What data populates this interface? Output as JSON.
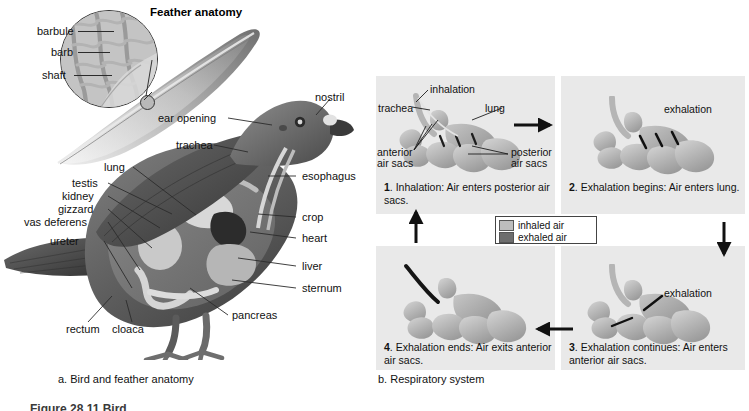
{
  "figure": {
    "number_line": "Figure 28.11  Bird",
    "panel_a_caption": "a. Bird and feather anatomy",
    "panel_b_caption": "b. Respiratory system"
  },
  "panel_a": {
    "title": "Feather anatomy",
    "feather_labels": [
      {
        "id": "barbule",
        "label": "barbule"
      },
      {
        "id": "barb",
        "label": "barb"
      },
      {
        "id": "shaft",
        "label": "shaft"
      }
    ],
    "bird_labels_left": [
      {
        "id": "lung",
        "label": "lung"
      },
      {
        "id": "testis",
        "label": "testis"
      },
      {
        "id": "kidney",
        "label": "kidney"
      },
      {
        "id": "gizzard",
        "label": "gizzard"
      },
      {
        "id": "vas-deferens",
        "label": "vas deferens"
      },
      {
        "id": "ureter",
        "label": "ureter"
      },
      {
        "id": "rectum",
        "label": "rectum"
      },
      {
        "id": "cloaca",
        "label": "cloaca"
      }
    ],
    "bird_labels_head": [
      {
        "id": "ear-opening",
        "label": "ear opening"
      },
      {
        "id": "nostril",
        "label": "nostril"
      },
      {
        "id": "trachea",
        "label": "trachea"
      }
    ],
    "bird_labels_right": [
      {
        "id": "esophagus",
        "label": "esophagus"
      },
      {
        "id": "crop",
        "label": "crop"
      },
      {
        "id": "heart",
        "label": "heart"
      },
      {
        "id": "liver",
        "label": "liver"
      },
      {
        "id": "sternum",
        "label": "sternum"
      },
      {
        "id": "pancreas",
        "label": "pancreas"
      }
    ]
  },
  "panel_b": {
    "legend": [
      {
        "id": "inhaled-air",
        "label": "inhaled air",
        "color": "#bdbdbd"
      },
      {
        "id": "exhaled-air",
        "label": "exhaled air",
        "color": "#6e6e6e"
      }
    ],
    "steps": [
      {
        "num": "1",
        "text": "Inhalation: Air enters posterior air sacs."
      },
      {
        "num": "2",
        "text": "Exhalation begins: Air enters lung."
      },
      {
        "num": "3",
        "text": "Exhalation continues: Air enters anterior air sacs."
      },
      {
        "num": "4",
        "text": "Exhalation ends: Air exits anterior air sacs."
      }
    ],
    "step1_anatomy": [
      {
        "id": "inhalation",
        "label": "inhalation"
      },
      {
        "id": "trachea",
        "label": "trachea"
      },
      {
        "id": "lung",
        "label": "lung"
      },
      {
        "id": "anterior-air-sacs",
        "label": "anterior\nair sacs"
      },
      {
        "id": "posterior-air-sacs",
        "label": "posterior\nair sacs"
      }
    ],
    "step2_anatomy": [
      {
        "id": "exhalation",
        "label": "exhalation"
      }
    ],
    "step3_anatomy": [
      {
        "id": "exhalation",
        "label": "exhalation"
      }
    ],
    "flow_arrows": [
      "right",
      "down",
      "left",
      "up"
    ]
  },
  "colors": {
    "panel_bg": "#e9e9e9",
    "page_bg": "#ffffff",
    "ink": "#111111",
    "organ_light": "#cfcfcf",
    "organ_dark": "#8a8a8a"
  }
}
